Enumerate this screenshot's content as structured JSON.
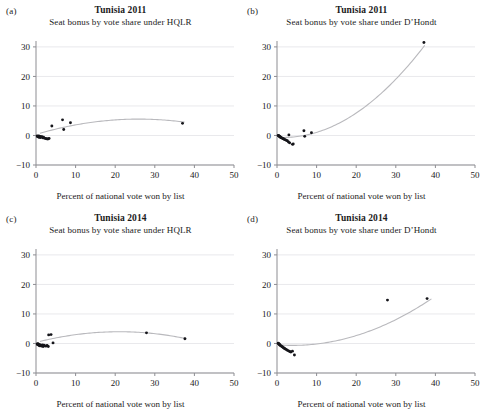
{
  "figure": {
    "shared_xlabel": "Percent of national vote won by list",
    "xticks": [
      0,
      10,
      20,
      30,
      40,
      50
    ],
    "yticks": [
      30,
      20,
      10,
      0,
      -10
    ],
    "xlim": [
      0,
      50
    ],
    "ylim": [
      -10,
      32
    ],
    "grid_color": "#e9e9ec",
    "point_color": "#15151a",
    "curve_color": "#b9b9bd"
  },
  "chart_data": [
    {
      "type": "scatter",
      "panel": "(a)",
      "title": "Tunisia 2011",
      "subtitle": "Seat bonus by vote share under HQLR",
      "xlabel": "Percent of national vote won by list",
      "ylabel": "",
      "xlim": [
        0,
        50
      ],
      "ylim": [
        -10,
        32
      ],
      "xticks": [
        0,
        10,
        20,
        30,
        40,
        50
      ],
      "yticks": [
        -10,
        0,
        10,
        20,
        30
      ],
      "grid": true,
      "legend": "none",
      "points": [
        {
          "x": 0.3,
          "y": -0.2
        },
        {
          "x": 0.4,
          "y": -0.4
        },
        {
          "x": 0.5,
          "y": -0.3
        },
        {
          "x": 0.6,
          "y": -0.5
        },
        {
          "x": 0.7,
          "y": -0.2
        },
        {
          "x": 0.8,
          "y": -0.6
        },
        {
          "x": 0.9,
          "y": -0.4
        },
        {
          "x": 1.0,
          "y": -0.3
        },
        {
          "x": 1.1,
          "y": -0.7
        },
        {
          "x": 1.3,
          "y": -0.5
        },
        {
          "x": 1.5,
          "y": -0.4
        },
        {
          "x": 1.7,
          "y": -0.8
        },
        {
          "x": 1.9,
          "y": -0.6
        },
        {
          "x": 2.1,
          "y": -0.9
        },
        {
          "x": 2.4,
          "y": -1.0
        },
        {
          "x": 2.7,
          "y": -1.1
        },
        {
          "x": 3.0,
          "y": -1.2
        },
        {
          "x": 3.3,
          "y": -1.0
        },
        {
          "x": 4.0,
          "y": 3.2
        },
        {
          "x": 6.7,
          "y": 5.3
        },
        {
          "x": 7.0,
          "y": 2.0
        },
        {
          "x": 8.7,
          "y": 4.3
        },
        {
          "x": 37.0,
          "y": 4.1
        }
      ],
      "fit": {
        "kind": "quadratic",
        "description": "concave-down fitted curve rising from ~0 at x=0 to peak ~5.6 near x=25, falling to ~4.2 at x=37",
        "x_start": 1.0,
        "x_end": 37.5,
        "coefficients": {
          "a": -0.0077,
          "b": 0.4,
          "c": 0.35
        }
      }
    },
    {
      "type": "scatter",
      "panel": "(b)",
      "title": "Tunisia 2011",
      "subtitle": "Seat bonus by vote share under D’Hondt",
      "xlabel": "Percent of national vote won by list",
      "ylabel": "",
      "xlim": [
        0,
        50
      ],
      "ylim": [
        -10,
        32
      ],
      "xticks": [
        0,
        10,
        20,
        30,
        40,
        50
      ],
      "yticks": [
        -10,
        0,
        10,
        20,
        30
      ],
      "grid": true,
      "legend": "none",
      "points": [
        {
          "x": 0.3,
          "y": 0.0
        },
        {
          "x": 0.4,
          "y": -0.1
        },
        {
          "x": 0.5,
          "y": -0.2
        },
        {
          "x": 0.6,
          "y": -0.3
        },
        {
          "x": 0.7,
          "y": -0.4
        },
        {
          "x": 0.8,
          "y": -0.5
        },
        {
          "x": 0.9,
          "y": -0.6
        },
        {
          "x": 1.0,
          "y": -0.7
        },
        {
          "x": 1.2,
          "y": -0.8
        },
        {
          "x": 1.4,
          "y": -1.0
        },
        {
          "x": 1.6,
          "y": -1.1
        },
        {
          "x": 1.8,
          "y": -1.3
        },
        {
          "x": 2.0,
          "y": -1.4
        },
        {
          "x": 2.3,
          "y": -1.6
        },
        {
          "x": 2.6,
          "y": -1.8
        },
        {
          "x": 2.9,
          "y": -2.2
        },
        {
          "x": 3.2,
          "y": -2.5
        },
        {
          "x": 3.0,
          "y": 0.2
        },
        {
          "x": 3.9,
          "y": -3.0
        },
        {
          "x": 4.1,
          "y": -2.9
        },
        {
          "x": 6.8,
          "y": 1.6
        },
        {
          "x": 7.0,
          "y": -0.3
        },
        {
          "x": 8.7,
          "y": 0.9
        },
        {
          "x": 37.1,
          "y": 31.5
        }
      ],
      "fit": {
        "kind": "quadratic",
        "description": "convex upward fitted curve flat near -0.8 below x=10, rising steeply to ~31 at x=37",
        "x_start": 0.5,
        "x_end": 37.3,
        "coefficients": {
          "a": 0.0245,
          "b": -0.08,
          "c": -0.6
        }
      }
    },
    {
      "type": "scatter",
      "panel": "(c)",
      "title": "Tunisia 2014",
      "subtitle": "Seat bonus by vote share under HQLR",
      "xlabel": "Percent of national vote won by list",
      "ylabel": "",
      "xlim": [
        0,
        50
      ],
      "ylim": [
        -10,
        32
      ],
      "xticks": [
        0,
        10,
        20,
        30,
        40,
        50
      ],
      "yticks": [
        -10,
        0,
        10,
        20,
        30
      ],
      "grid": true,
      "legend": "none",
      "points": [
        {
          "x": 0.3,
          "y": -0.2
        },
        {
          "x": 0.4,
          "y": -0.4
        },
        {
          "x": 0.5,
          "y": -0.1
        },
        {
          "x": 0.6,
          "y": -0.5
        },
        {
          "x": 0.7,
          "y": -0.3
        },
        {
          "x": 0.8,
          "y": -0.6
        },
        {
          "x": 0.9,
          "y": -0.8
        },
        {
          "x": 1.0,
          "y": -0.4
        },
        {
          "x": 1.2,
          "y": -0.7
        },
        {
          "x": 1.4,
          "y": -0.9
        },
        {
          "x": 1.6,
          "y": -0.5
        },
        {
          "x": 1.8,
          "y": -1.0
        },
        {
          "x": 2.0,
          "y": -0.6
        },
        {
          "x": 2.2,
          "y": -0.8
        },
        {
          "x": 2.5,
          "y": -0.9
        },
        {
          "x": 2.8,
          "y": -0.7
        },
        {
          "x": 3.1,
          "y": -1.0
        },
        {
          "x": 3.2,
          "y": 2.9
        },
        {
          "x": 3.8,
          "y": 3.0
        },
        {
          "x": 4.3,
          "y": 0.2
        },
        {
          "x": 27.9,
          "y": 3.6
        },
        {
          "x": 37.6,
          "y": 1.6
        }
      ],
      "fit": {
        "kind": "quadratic",
        "description": "concave-down fitted curve rising from ~0.3 to peak ~4.0 near x=21, falling to ~1.7 at x=38",
        "x_start": 1.0,
        "x_end": 38.0,
        "coefficients": {
          "a": -0.0082,
          "b": 0.345,
          "c": 0.35
        }
      }
    },
    {
      "type": "scatter",
      "panel": "(d)",
      "title": "Tunisia 2014",
      "subtitle": "Seat bonus by vote share under D’Hondt",
      "xlabel": "Percent of national vote won by list",
      "ylabel": "",
      "xlim": [
        0,
        50
      ],
      "ylim": [
        -10,
        32
      ],
      "xticks": [
        0,
        10,
        20,
        30,
        40,
        50
      ],
      "yticks": [
        -10,
        0,
        10,
        20,
        30
      ],
      "grid": true,
      "legend": "none",
      "points": [
        {
          "x": 0.3,
          "y": 0.1
        },
        {
          "x": 0.4,
          "y": -0.1
        },
        {
          "x": 0.5,
          "y": -0.2
        },
        {
          "x": 0.6,
          "y": -0.3
        },
        {
          "x": 0.7,
          "y": -0.5
        },
        {
          "x": 0.8,
          "y": -0.6
        },
        {
          "x": 1.0,
          "y": -0.8
        },
        {
          "x": 1.2,
          "y": -1.0
        },
        {
          "x": 1.4,
          "y": -1.2
        },
        {
          "x": 1.6,
          "y": -1.4
        },
        {
          "x": 1.8,
          "y": -1.6
        },
        {
          "x": 2.0,
          "y": -1.8
        },
        {
          "x": 2.3,
          "y": -2.0
        },
        {
          "x": 2.6,
          "y": -2.3
        },
        {
          "x": 2.9,
          "y": -2.5
        },
        {
          "x": 3.2,
          "y": -2.7
        },
        {
          "x": 3.5,
          "y": -2.9
        },
        {
          "x": 3.9,
          "y": -2.6
        },
        {
          "x": 4.4,
          "y": -3.9
        },
        {
          "x": 27.9,
          "y": 14.7
        },
        {
          "x": 37.9,
          "y": 15.2
        }
      ],
      "fit": {
        "kind": "quadratic",
        "description": "convex upward fitted curve near -0.6 below x=8, rising to ~18.5 at x=39",
        "x_start": 1.0,
        "x_end": 39.0,
        "coefficients": {
          "a": 0.0128,
          "b": -0.1,
          "c": -0.45
        }
      }
    }
  ]
}
